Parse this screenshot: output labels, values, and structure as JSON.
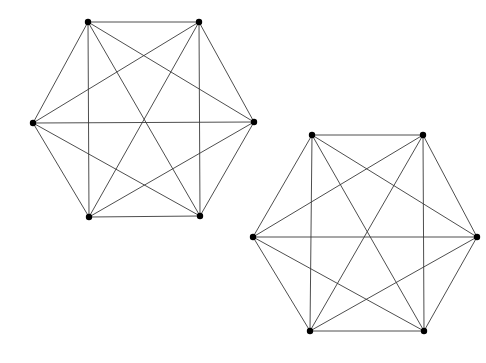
{
  "figure": {
    "title": "",
    "background_color": "#ffffff",
    "edge_color": "#3a3a3a",
    "vertex_color": "#000000",
    "edge_width": 0.9,
    "vertex_radius": 3.2,
    "width": 486,
    "height": 363
  },
  "chart_data": {
    "type": "diagram",
    "diagram_kind": "graph",
    "title": "",
    "subtitle": "",
    "xlabel": "",
    "ylabel": "",
    "grid": false,
    "legend": null,
    "annotations": [],
    "graphs": [
      {
        "name": "graph-left",
        "graph_label": "K6",
        "vertex_count": 6,
        "edge_count": 15,
        "center": [
          143,
          120
        ],
        "vertices": [
          {
            "id": "A",
            "x": 88,
            "y": 22
          },
          {
            "id": "B",
            "x": 199,
            "y": 22
          },
          {
            "id": "C",
            "x": 254,
            "y": 122
          },
          {
            "id": "D",
            "x": 200,
            "y": 216
          },
          {
            "id": "E",
            "x": 89,
            "y": 217
          },
          {
            "id": "F",
            "x": 33,
            "y": 123
          }
        ],
        "edges": [
          [
            "A",
            "B"
          ],
          [
            "A",
            "C"
          ],
          [
            "A",
            "D"
          ],
          [
            "A",
            "E"
          ],
          [
            "A",
            "F"
          ],
          [
            "B",
            "C"
          ],
          [
            "B",
            "D"
          ],
          [
            "B",
            "E"
          ],
          [
            "B",
            "F"
          ],
          [
            "C",
            "D"
          ],
          [
            "C",
            "E"
          ],
          [
            "C",
            "F"
          ],
          [
            "D",
            "E"
          ],
          [
            "D",
            "F"
          ],
          [
            "E",
            "F"
          ]
        ]
      },
      {
        "name": "graph-right",
        "graph_label": "K6",
        "vertex_count": 6,
        "edge_count": 15,
        "center": [
          365,
          233
        ],
        "vertices": [
          {
            "id": "A",
            "x": 312,
            "y": 135
          },
          {
            "id": "B",
            "x": 423,
            "y": 135
          },
          {
            "id": "C",
            "x": 477,
            "y": 237
          },
          {
            "id": "D",
            "x": 424,
            "y": 331
          },
          {
            "id": "E",
            "x": 310,
            "y": 331
          },
          {
            "id": "F",
            "x": 253,
            "y": 237
          }
        ],
        "edges": [
          [
            "A",
            "B"
          ],
          [
            "A",
            "C"
          ],
          [
            "A",
            "D"
          ],
          [
            "A",
            "E"
          ],
          [
            "A",
            "F"
          ],
          [
            "B",
            "C"
          ],
          [
            "B",
            "D"
          ],
          [
            "B",
            "E"
          ],
          [
            "B",
            "F"
          ],
          [
            "C",
            "D"
          ],
          [
            "C",
            "E"
          ],
          [
            "C",
            "F"
          ],
          [
            "D",
            "E"
          ],
          [
            "D",
            "F"
          ],
          [
            "E",
            "F"
          ]
        ]
      }
    ]
  }
}
